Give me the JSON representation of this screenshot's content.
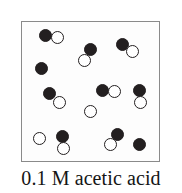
{
  "figure": {
    "caption": "0.1 M acetic acid",
    "box": {
      "x": 21,
      "y": 21,
      "width": 139,
      "height": 141,
      "border_color": "#8a8a8a",
      "fill_color": "#fdfdfd"
    },
    "legend_semantics": {
      "filled_circle": "undissociated acetic acid molecule / solute particle",
      "open_circle": "water or ion particle"
    },
    "colors": {
      "filled": "#231f20",
      "open_fill": "#ffffff",
      "open_stroke": "#231f20",
      "caption_text": "#151515"
    },
    "particles": [
      {
        "name": "particle-filled-1",
        "type": "filled",
        "cx": 44,
        "cy": 34,
        "d": 13
      },
      {
        "name": "particle-open-1",
        "type": "open",
        "cx": 56,
        "cy": 36,
        "d": 13
      },
      {
        "name": "particle-filled-2",
        "type": "filled",
        "cx": 89,
        "cy": 48,
        "d": 13
      },
      {
        "name": "particle-open-2",
        "type": "open",
        "cx": 83,
        "cy": 59,
        "d": 13
      },
      {
        "name": "particle-filled-3",
        "type": "filled",
        "cx": 121,
        "cy": 43,
        "d": 13
      },
      {
        "name": "particle-open-3",
        "type": "open",
        "cx": 131,
        "cy": 50,
        "d": 13
      },
      {
        "name": "particle-filled-4",
        "type": "filled",
        "cx": 40,
        "cy": 67,
        "d": 13
      },
      {
        "name": "particle-filled-5",
        "type": "filled",
        "cx": 48,
        "cy": 92,
        "d": 13
      },
      {
        "name": "particle-open-4",
        "type": "open",
        "cx": 58,
        "cy": 101,
        "d": 13
      },
      {
        "name": "particle-filled-6",
        "type": "filled",
        "cx": 101,
        "cy": 89,
        "d": 13
      },
      {
        "name": "particle-open-5",
        "type": "open",
        "cx": 113,
        "cy": 90,
        "d": 13
      },
      {
        "name": "particle-filled-7",
        "type": "filled",
        "cx": 138,
        "cy": 89,
        "d": 13
      },
      {
        "name": "particle-open-6",
        "type": "open",
        "cx": 139,
        "cy": 101,
        "d": 13
      },
      {
        "name": "particle-open-7",
        "type": "open",
        "cx": 89,
        "cy": 110,
        "d": 13
      },
      {
        "name": "particle-open-8",
        "type": "open",
        "cx": 38,
        "cy": 137,
        "d": 13
      },
      {
        "name": "particle-filled-8",
        "type": "filled",
        "cx": 61,
        "cy": 135,
        "d": 13
      },
      {
        "name": "particle-open-9",
        "type": "open",
        "cx": 62,
        "cy": 147,
        "d": 13
      },
      {
        "name": "particle-filled-9",
        "type": "filled",
        "cx": 116,
        "cy": 133,
        "d": 13
      },
      {
        "name": "particle-open-10",
        "type": "open",
        "cx": 109,
        "cy": 143,
        "d": 13
      },
      {
        "name": "particle-filled-10",
        "type": "filled",
        "cx": 138,
        "cy": 143,
        "d": 13
      }
    ]
  }
}
